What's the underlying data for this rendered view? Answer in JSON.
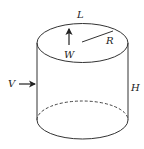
{
  "figure": {
    "shape": "cylinder",
    "stroke_color": "#333333",
    "labels": {
      "top_circumference": "L",
      "radius": "R",
      "weight": "W",
      "velocity": "V",
      "height": "H"
    }
  }
}
